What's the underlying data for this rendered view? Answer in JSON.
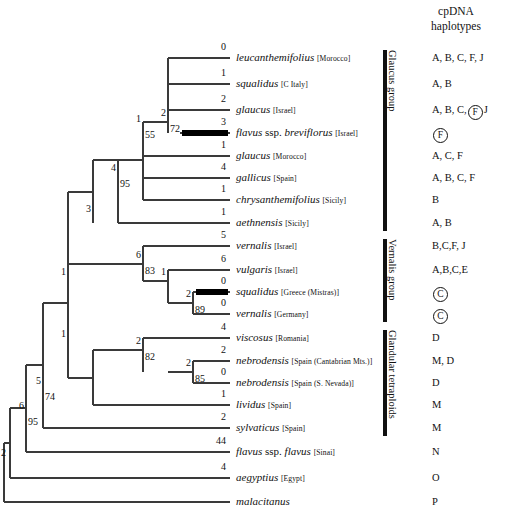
{
  "header": {
    "line1": "cpDNA",
    "line2": "haplotypes"
  },
  "tree": {
    "taxa": [
      {
        "id": "leucanthemifolius",
        "sci": "leucanthemifolius",
        "plain": "",
        "loc": "[Morocco]",
        "y": 58,
        "branch_length": "0",
        "haplotype_plain": "A, B, C, F, J",
        "haplotype_circled": []
      },
      {
        "id": "squalidus-citaly",
        "sci": "squalidus",
        "plain": "",
        "loc": "[C Italy]",
        "y": 84,
        "branch_length": "1",
        "haplotype_plain": "A, B",
        "haplotype_circled": []
      },
      {
        "id": "glaucus-israel",
        "sci": "glaucus",
        "plain": "",
        "loc": "[Israel]",
        "y": 110,
        "branch_length": "2",
        "haplotype_plain": "A, B, C,",
        "haplotype_circled": [
          "F"
        ],
        "haplotype_tail": "J"
      },
      {
        "id": "flavus-breviflorus",
        "sci": "flavus",
        "plain": " ssp. ",
        "sci2": "breviflorus",
        "loc": "[Israel]",
        "y": 133,
        "branch_length": "3",
        "haplotype_plain": "",
        "haplotype_circled": [
          "F"
        ]
      },
      {
        "id": "glaucus-morocco",
        "sci": "glaucus",
        "plain": "",
        "loc": "[Morocco]",
        "y": 156,
        "branch_length": "1",
        "haplotype_plain": "A, C, F",
        "haplotype_circled": []
      },
      {
        "id": "gallicus",
        "sci": "gallicus",
        "plain": "",
        "loc": "[Spain]",
        "y": 178,
        "branch_length": "4",
        "haplotype_plain": "A, B, C, F",
        "haplotype_circled": []
      },
      {
        "id": "chrysanthemifolius",
        "sci": "chrysanthemifolius",
        "plain": "",
        "loc": "[Sicily]",
        "y": 200,
        "branch_length": "1",
        "haplotype_plain": "B",
        "haplotype_circled": []
      },
      {
        "id": "aethnensis",
        "sci": "aethnensis",
        "plain": "",
        "loc": "[Sicily]",
        "y": 223,
        "branch_length": "1",
        "haplotype_plain": "A, B",
        "haplotype_circled": []
      },
      {
        "id": "vernalis-israel",
        "sci": "vernalis",
        "plain": "",
        "loc": "[Israel]",
        "y": 246,
        "branch_length": "5",
        "haplotype_plain": "B,C,F, J",
        "haplotype_circled": []
      },
      {
        "id": "vulgaris-israel",
        "sci": "vulgaris",
        "plain": "",
        "loc": "[Israel]",
        "y": 270,
        "branch_length": "6",
        "haplotype_plain": "A,B,C,E",
        "haplotype_circled": []
      },
      {
        "id": "squalidus-greece",
        "sci": "squalidus",
        "plain": "",
        "loc": "[Greece (Mistras)]",
        "y": 292,
        "branch_length": "0",
        "haplotype_plain": "",
        "haplotype_circled": [
          "C"
        ]
      },
      {
        "id": "vernalis-germany",
        "sci": "vernalis",
        "plain": "",
        "loc": "[Germany]",
        "y": 314,
        "branch_length": "0",
        "haplotype_plain": "",
        "haplotype_circled": [
          "C"
        ]
      },
      {
        "id": "viscosus",
        "sci": "viscosus",
        "plain": "",
        "loc": "[Romania]",
        "y": 338,
        "branch_length": "4",
        "haplotype_plain": "D",
        "haplotype_circled": []
      },
      {
        "id": "nebrodensis-cantabrian",
        "sci": "nebrodensis",
        "plain": "",
        "loc": "[Spain (Cantabrian Mts.)]",
        "y": 361,
        "branch_length": "2",
        "haplotype_plain": "M, D",
        "haplotype_circled": []
      },
      {
        "id": "nebrodensis-nevada",
        "sci": "nebrodensis",
        "plain": "",
        "loc": "[Spain (S. Nevada)]",
        "y": 383,
        "branch_length": "0",
        "haplotype_plain": "D",
        "haplotype_circled": []
      },
      {
        "id": "lividus",
        "sci": "lividus",
        "plain": "",
        "loc": "[Spain]",
        "y": 405,
        "branch_length": "1",
        "haplotype_plain": "M",
        "haplotype_circled": []
      },
      {
        "id": "sylvaticus",
        "sci": "sylvaticus",
        "plain": "",
        "loc": "[Spain]",
        "y": 428,
        "branch_length": "2",
        "haplotype_plain": "M",
        "haplotype_circled": []
      },
      {
        "id": "flavus-flavus",
        "sci": "flavus",
        "plain": " ssp. ",
        "sci2": "flavus",
        "loc": "[Sinai]",
        "y": 452,
        "branch_length": "44",
        "haplotype_plain": "N",
        "haplotype_circled": []
      },
      {
        "id": "aegyptius",
        "sci": "aegyptius",
        "plain": "",
        "loc": "[Egypt]",
        "y": 478,
        "branch_length": "4",
        "haplotype_plain": "O",
        "haplotype_circled": []
      },
      {
        "id": "malacitanus",
        "sci": "malacitanus",
        "plain": "",
        "loc": "",
        "y": 502,
        "branch_length": "",
        "haplotype_plain": "P",
        "haplotype_circled": []
      }
    ],
    "internal_nodes": [
      {
        "id": "node-72",
        "branch_length": "2",
        "bootstrap": "72",
        "x": 168,
        "y": 122
      },
      {
        "id": "node-55",
        "branch_length": "1",
        "bootstrap": "55",
        "x": 143,
        "y": 128
      },
      {
        "id": "node-95-glaucus",
        "branch_length": "4",
        "bootstrap": "95",
        "x": 118,
        "y": 177
      },
      {
        "id": "node-3",
        "branch_length": "3",
        "bootstrap": "",
        "x": 93,
        "y": 218
      },
      {
        "id": "node-83",
        "branch_length": "6",
        "bootstrap": "83",
        "x": 143,
        "y": 264
      },
      {
        "id": "node-1-vernalis",
        "branch_length": "1",
        "bootstrap": "",
        "x": 168,
        "y": 281
      },
      {
        "id": "node-89",
        "branch_length": "2",
        "bootstrap": "89",
        "x": 193,
        "y": 303
      },
      {
        "id": "node-1-upper",
        "branch_length": "1",
        "bootstrap": "",
        "x": 68,
        "y": 281
      },
      {
        "id": "node-82",
        "branch_length": "2",
        "bootstrap": "82",
        "x": 143,
        "y": 350
      },
      {
        "id": "node-85",
        "branch_length": "2",
        "bootstrap": "85",
        "x": 193,
        "y": 372
      },
      {
        "id": "node-1-lower",
        "branch_length": "1",
        "bootstrap": "",
        "x": 68,
        "y": 343
      },
      {
        "id": "node-74",
        "branch_length": "5",
        "bootstrap": "74",
        "x": 43,
        "y": 390
      },
      {
        "id": "node-95-lower",
        "branch_length": "6",
        "bootstrap": "95",
        "x": 26,
        "y": 415
      },
      {
        "id": "node-2-root",
        "branch_length": "2",
        "bootstrap": "",
        "x": 8,
        "y": 462
      }
    ],
    "thick_branches": [
      "flavus-breviflorus",
      "squalidus-greece"
    ],
    "line_color": "#3a3a3a"
  },
  "groups": [
    {
      "id": "glaucus-group",
      "label": "Glaucus group",
      "top": 50,
      "bottom": 231
    },
    {
      "id": "vernalis-group",
      "label": "Vernalis group",
      "top": 239,
      "bottom": 322
    },
    {
      "id": "glandular-tetraploids",
      "label": "Glandular tetraploids",
      "top": 330,
      "bottom": 436
    }
  ]
}
